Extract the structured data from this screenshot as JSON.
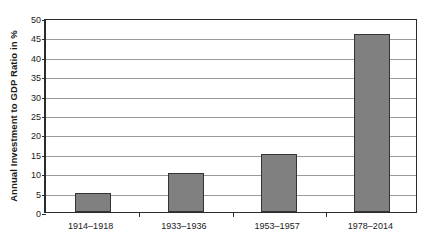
{
  "chart_data": {
    "type": "bar",
    "title": "",
    "xlabel": "",
    "ylabel": "Annual Investment to GDP Ratio in %",
    "categories": [
      "1914–1918",
      "1933–1936",
      "1953–1957",
      "1978–2014"
    ],
    "values": [
      5,
      10,
      15,
      46
    ],
    "series": [
      {
        "name": "Annual Investment to GDP Ratio",
        "values": [
          5,
          10,
          15,
          46
        ]
      }
    ],
    "ylim": [
      0,
      50
    ],
    "y_ticks": [
      0,
      5,
      10,
      15,
      20,
      25,
      30,
      35,
      40,
      45,
      50
    ],
    "y_tick_labels": [
      "0",
      "5",
      "10",
      "15",
      "20",
      "25",
      "30",
      "35",
      "40",
      "45",
      "50"
    ],
    "grid": true,
    "grid_axis": "y",
    "legend": false,
    "legend_position": "none",
    "bar_color": "#808080",
    "bar_edge_color": "#343434",
    "gridline_color": "#9a9a9a",
    "axis_color": "#2b2b2b",
    "background_color": "#ffffff"
  }
}
